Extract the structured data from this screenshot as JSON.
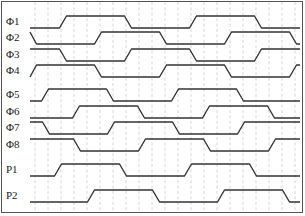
{
  "plot": {
    "width": 305,
    "height": 216,
    "label_column_width": 30,
    "track_left": 30,
    "track_right": 300,
    "border_color": "#555555",
    "grid_color": "#cccccc",
    "wave_color": "#333333",
    "background": "#ffffff",
    "grid_spacing_px": 13,
    "grid_dashed": true,
    "period_px": 130,
    "rise_time_px": 7
  },
  "signals": [
    {
      "label": "Φ1",
      "name": "phi1",
      "y_label": 22,
      "y_high": 16,
      "y_low": 28,
      "start_level": "low",
      "first_edge_x": 63,
      "offset_px": 0
    },
    {
      "label": "Φ2",
      "name": "phi2",
      "y_label": 38,
      "y_high": 32,
      "y_low": 44,
      "start_level": "high",
      "first_edge_x": 33,
      "offset_px": 0
    },
    {
      "label": "Φ3",
      "name": "phi3",
      "y_label": 55,
      "y_high": 49,
      "y_low": 61,
      "start_level": "high",
      "first_edge_x": 63,
      "offset_px": 0
    },
    {
      "label": "Φ4",
      "name": "phi4",
      "y_label": 71,
      "y_high": 65,
      "y_low": 77,
      "start_level": "low",
      "first_edge_x": 33,
      "offset_px": 0
    },
    {
      "label": "Φ5",
      "name": "phi5",
      "y_label": 95,
      "y_high": 89,
      "y_low": 101,
      "start_level": "low",
      "first_edge_x": 45,
      "offset_px": 0
    },
    {
      "label": "Φ6",
      "name": "phi6",
      "y_label": 112,
      "y_high": 106,
      "y_low": 118,
      "start_level": "low",
      "first_edge_x": 76,
      "offset_px": 0
    },
    {
      "label": "Φ7",
      "name": "phi7",
      "y_label": 128,
      "y_high": 122,
      "y_low": 134,
      "start_level": "high",
      "first_edge_x": 46,
      "offset_px": 0
    },
    {
      "label": "Φ8",
      "name": "phi8",
      "y_label": 145,
      "y_high": 139,
      "y_low": 151,
      "start_level": "high",
      "first_edge_x": 77,
      "offset_px": 0
    },
    {
      "label": "P1",
      "name": "p1",
      "y_label": 170,
      "y_high": 164,
      "y_low": 176,
      "start_level": "low",
      "first_edge_x": 58,
      "offset_px": 0
    },
    {
      "label": "P2",
      "name": "p2",
      "y_label": 196,
      "y_high": 190,
      "y_low": 202,
      "start_level": "low",
      "first_edge_x": 91,
      "offset_px": 0
    }
  ],
  "chart_data": {
    "type": "line",
    "xlabel": "",
    "ylabel": "",
    "grid": true,
    "legend_position": "left",
    "x_range_px": [
      30,
      300
    ],
    "period_px": 130,
    "duty_cycle": 0.5,
    "series": [
      {
        "name": "Φ1",
        "transitions_px": [
          63,
          128,
          193,
          258
        ],
        "start_level": 0
      },
      {
        "name": "Φ2",
        "transitions_px": [
          33,
          98,
          163,
          228,
          293
        ],
        "start_level": 1
      },
      {
        "name": "Φ3",
        "transitions_px": [
          63,
          128,
          193,
          258
        ],
        "start_level": 1
      },
      {
        "name": "Φ4",
        "transitions_px": [
          33,
          98,
          163,
          228,
          293
        ],
        "start_level": 0
      },
      {
        "name": "Φ5",
        "transitions_px": [
          45,
          110,
          175,
          240
        ],
        "start_level": 0
      },
      {
        "name": "Φ6",
        "transitions_px": [
          76,
          141,
          206,
          271
        ],
        "start_level": 0
      },
      {
        "name": "Φ7",
        "transitions_px": [
          46,
          111,
          176,
          241
        ],
        "start_level": 1
      },
      {
        "name": "Φ8",
        "transitions_px": [
          77,
          142,
          207,
          272
        ],
        "start_level": 1
      },
      {
        "name": "P1",
        "transitions_px": [
          58,
          123,
          188,
          253
        ],
        "start_level": 0
      },
      {
        "name": "P2",
        "transitions_px": [
          91,
          156,
          221,
          286
        ],
        "start_level": 0
      }
    ]
  }
}
